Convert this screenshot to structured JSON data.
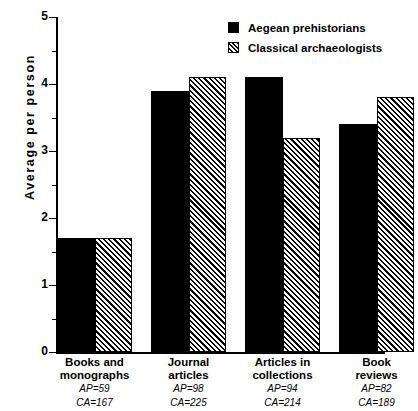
{
  "chart_data": {
    "type": "bar",
    "title": "",
    "xlabel": "",
    "ylabel": "Average  per  person",
    "ylim": [
      0,
      5
    ],
    "yticks": [
      0,
      1,
      2,
      3,
      4,
      5
    ],
    "ytick_labels": [
      "0",
      "1",
      "2",
      "3",
      "4",
      "5"
    ],
    "minor_ticks": [
      0.5,
      1.5,
      2.5,
      3.5,
      4.5
    ],
    "grid": false,
    "legend_position": "top-right",
    "categories": [
      "Books and monographs",
      "Journal articles",
      "Articles in collections",
      "Book reviews"
    ],
    "series": [
      {
        "name": "Aegean prehistorians",
        "fill": "solid",
        "color": "#000000",
        "values": [
          1.7,
          3.9,
          4.1,
          3.4
        ]
      },
      {
        "name": "Classical archaeologists",
        "fill": "hatched",
        "color": "#000000",
        "values": [
          1.7,
          4.1,
          3.2,
          3.8
        ]
      }
    ],
    "annotations": [
      {
        "category": "Books and monographs",
        "line1": "AP=59",
        "line2": "CA=167"
      },
      {
        "category": "Journal articles",
        "line1": "AP=98",
        "line2": "CA=225"
      },
      {
        "category": "Articles in collections",
        "line1": "AP=94",
        "line2": "CA=214"
      },
      {
        "category": "Book reviews",
        "line1": "AP=82",
        "line2": "CA=189"
      }
    ]
  },
  "axis": {
    "y_label": "Average  per  person",
    "ytick_0": "0",
    "ytick_1": "1",
    "ytick_2": "2",
    "ytick_3": "3",
    "ytick_4": "4",
    "ytick_5": "5"
  },
  "legend": {
    "items": [
      {
        "label": "Aegean prehistorians"
      },
      {
        "label": "Classical archaeologists"
      }
    ]
  },
  "categories": [
    {
      "line1": "Books and",
      "line2": "monographs",
      "ap": "AP=59",
      "ca": "CA=167"
    },
    {
      "line1": "Journal",
      "line2": "articles",
      "ap": "AP=98",
      "ca": "CA=225"
    },
    {
      "line1": "Articles in",
      "line2": "collections",
      "ap": "AP=94",
      "ca": "CA=214"
    },
    {
      "line1": "Book",
      "line2": "reviews",
      "ap": "AP=82",
      "ca": "CA=189"
    }
  ]
}
